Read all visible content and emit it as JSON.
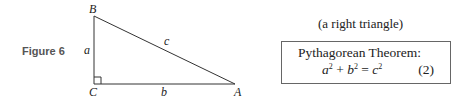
{
  "figure": {
    "label": "Figure 6",
    "vertices": {
      "A": "A",
      "B": "B",
      "C": "C"
    },
    "sides": {
      "a": "a",
      "b": "b",
      "c": "c"
    },
    "right_angle_at": "C"
  },
  "caption": "(a right triangle)",
  "theorem": {
    "title": "Pythagorean Theorem:",
    "equation": {
      "a": "a",
      "a_exp": "2",
      "plus": "+",
      "b": "b",
      "b_exp": "2",
      "equals": "=",
      "c": "c",
      "c_exp": "2"
    },
    "number": "(2)"
  },
  "colors": {
    "line": "#333333",
    "text": "#222222",
    "figure_label": "#555555",
    "box_border": "#666666"
  }
}
